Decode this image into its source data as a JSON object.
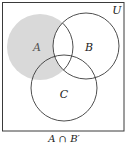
{
  "diagram": {
    "type": "venn",
    "universe": {
      "label": "U",
      "x": 2.5,
      "y": 2.5,
      "width": 121.5,
      "height": 128.5,
      "label_x": 117,
      "label_y": 14
    },
    "sets": [
      {
        "id": "A",
        "label": "A",
        "cx": 40,
        "cy": 47,
        "r": 33,
        "label_x": 37,
        "label_y": 51
      },
      {
        "id": "B",
        "label": "B",
        "cx": 86,
        "cy": 46,
        "r": 33,
        "label_x": 89,
        "label_y": 51
      },
      {
        "id": "C",
        "label": "C",
        "cx": 64,
        "cy": 88,
        "r": 33,
        "label_x": 64,
        "label_y": 98
      }
    ],
    "shaded_region": "A ∩ B′",
    "caption": "A ∩ B′",
    "colors": {
      "shade": "#d9d9d9",
      "stroke": "#3a3a3a",
      "background": "#ffffff"
    }
  }
}
